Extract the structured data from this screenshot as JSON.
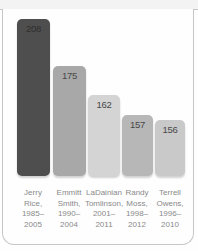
{
  "chart_data": {
    "type": "bar",
    "title": "",
    "xlabel": "",
    "ylabel": "",
    "categories": [
      "Jerry Rice, 1985–2005",
      "Emmitt Smith, 1990–2004",
      "LaDainian Tomlinson, 2001–2011",
      "Randy Moss, 1998–2012",
      "Terrell Owens, 1996–2010"
    ],
    "values": [
      208,
      175,
      162,
      157,
      156
    ],
    "layout": {
      "grid": "off",
      "axes": "none",
      "value_labels": "inside-top of each bar",
      "category_labels": "below bars, stacked on four lines"
    },
    "label_color": "#8a8a8a",
    "card_border_color": "#c6c6c6",
    "bars": [
      {
        "value": "208",
        "fill": "#4e4e4e",
        "value_color": "#2e2e2e",
        "label_lines": [
          "Jerry",
          "Rice,",
          "1985–",
          "2005"
        ]
      },
      {
        "value": "175",
        "fill": "#a8a8a8",
        "value_color": "#484848",
        "label_lines": [
          "Emmitt",
          "Smith,",
          "1990–",
          "2004"
        ]
      },
      {
        "value": "162",
        "fill": "#d4d4d4",
        "value_color": "#484848",
        "label_lines": [
          "LaDainian",
          "Tomlinson,",
          "2001–",
          "2011"
        ]
      },
      {
        "value": "157",
        "fill": "#b7b7b7",
        "value_color": "#484848",
        "label_lines": [
          "Randy",
          "Moss,",
          "1998–",
          "2012"
        ]
      },
      {
        "value": "156",
        "fill": "#c9c9c9",
        "value_color": "#484848",
        "label_lines": [
          "Terrell",
          "Owens,",
          "1996–",
          "2010"
        ]
      }
    ]
  }
}
